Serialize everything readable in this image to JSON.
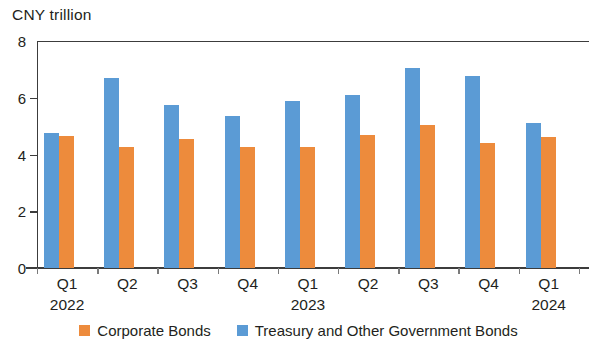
{
  "chart_data": {
    "type": "bar",
    "title": "",
    "ylabel": "CNY trillion",
    "xlabel": "",
    "ylim": [
      0,
      8
    ],
    "yticks": [
      0,
      2,
      4,
      6,
      8
    ],
    "ytick_labels": [
      "0",
      "2",
      "4",
      "6",
      "8"
    ],
    "grid": false,
    "legend_position": "bottom",
    "categories": [
      "Q1",
      "Q2",
      "Q3",
      "Q4",
      "Q1",
      "Q2",
      "Q3",
      "Q4",
      "Q1"
    ],
    "group_years": [
      {
        "label": "2022",
        "index": 0
      },
      {
        "label": "2023",
        "index": 4
      },
      {
        "label": "2024",
        "index": 8
      }
    ],
    "series": [
      {
        "name": "Corporate Bonds",
        "color": "#ed8b3c",
        "values": [
          4.65,
          4.25,
          4.55,
          4.25,
          4.25,
          4.7,
          5.05,
          4.4,
          4.6
        ]
      },
      {
        "name": "Treasury and Other Government Bonds",
        "color": "#5b9bd5",
        "values": [
          4.75,
          6.7,
          5.75,
          5.35,
          5.9,
          6.1,
          7.05,
          6.75,
          5.1
        ]
      }
    ]
  }
}
